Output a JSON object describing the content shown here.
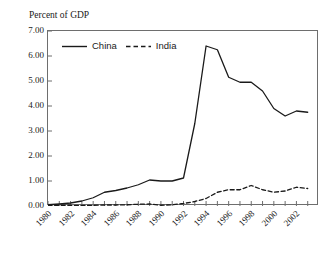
{
  "chart_data": {
    "type": "line",
    "title": "Percent of GDP",
    "xlabel": "",
    "ylabel": "Percent of GDP",
    "ylim": [
      0.0,
      7.0
    ],
    "xlim": [
      1980,
      2004
    ],
    "ytick_labels": [
      "0.00",
      "1.00",
      "2.00",
      "3.00",
      "4.00",
      "5.00",
      "6.00",
      "7.00"
    ],
    "ytick_values": [
      0.0,
      1.0,
      2.0,
      3.0,
      4.0,
      5.0,
      6.0,
      7.0
    ],
    "xtick_labels": [
      "1980",
      "1982",
      "1984",
      "1986",
      "1988",
      "1990",
      "1992",
      "1994",
      "1996",
      "1998",
      "2000",
      "2002"
    ],
    "xtick_values": [
      1980,
      1982,
      1984,
      1986,
      1988,
      1990,
      1992,
      1994,
      1996,
      1998,
      2000,
      2002
    ],
    "minor_xticks": [
      1981,
      1983,
      1985,
      1987,
      1989,
      1991,
      1993,
      1995,
      1997,
      1999,
      2001,
      2003
    ],
    "grid": false,
    "legend_position": "top-left-inside",
    "x": [
      1980,
      1981,
      1982,
      1983,
      1984,
      1985,
      1986,
      1987,
      1988,
      1989,
      1990,
      1991,
      1992,
      1993,
      1994,
      1995,
      1996,
      1997,
      1998,
      1999,
      2000,
      2001,
      2002,
      2003
    ],
    "series": [
      {
        "name": "China",
        "style": "solid",
        "color": "#1a1a1a",
        "values": [
          0.05,
          0.08,
          0.12,
          0.2,
          0.33,
          0.55,
          0.62,
          0.72,
          0.85,
          1.04,
          1.0,
          1.0,
          1.12,
          3.3,
          6.4,
          6.25,
          5.15,
          4.95,
          4.95,
          4.6,
          3.9,
          3.6,
          3.8,
          3.75
        ]
      },
      {
        "name": "India",
        "style": "dashed",
        "color": "#1a1a1a",
        "values": [
          0.02,
          0.03,
          0.03,
          0.02,
          0.03,
          0.04,
          0.04,
          0.05,
          0.07,
          0.08,
          0.03,
          0.05,
          0.1,
          0.18,
          0.3,
          0.55,
          0.65,
          0.65,
          0.82,
          0.65,
          0.55,
          0.6,
          0.75,
          0.7
        ]
      }
    ]
  },
  "legend": {
    "entries": [
      {
        "label": "China",
        "style": "solid"
      },
      {
        "label": "India",
        "style": "dashed"
      }
    ]
  }
}
